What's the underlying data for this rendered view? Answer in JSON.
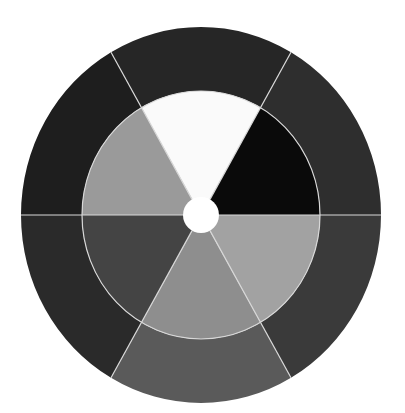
{
  "diagram": {
    "type": "two-ring sector wheel",
    "center": {
      "x": 201,
      "y": 215
    },
    "outer_ring": {
      "rx": 180,
      "ry": 188
    },
    "inner_ring": {
      "rx": 119,
      "ry": 124
    },
    "hub": {
      "r": 18,
      "color": "#ffffff"
    },
    "divider_color": "#d8d8d8",
    "divider_angles_deg": [
      0,
      60,
      120,
      180,
      240,
      300
    ],
    "outer_sectors": [
      {
        "name": "outer-upper-right",
        "start": 0,
        "end": 60,
        "color": "#2e2e2e"
      },
      {
        "name": "outer-top",
        "start": 60,
        "end": 120,
        "color": "#262626"
      },
      {
        "name": "outer-upper-left",
        "start": 120,
        "end": 180,
        "color": "#1e1e1e"
      },
      {
        "name": "outer-lower-left",
        "start": 180,
        "end": 240,
        "color": "#2a2a2a"
      },
      {
        "name": "outer-bottom",
        "start": 240,
        "end": 300,
        "color": "#5a5a5a"
      },
      {
        "name": "outer-lower-right",
        "start": 300,
        "end": 360,
        "color": "#3a3a3a"
      }
    ],
    "inner_sectors": [
      {
        "name": "inner-upper-right",
        "start": 0,
        "end": 60,
        "color": "#0a0a0a"
      },
      {
        "name": "inner-top",
        "start": 60,
        "end": 120,
        "color": "#fafafa"
      },
      {
        "name": "inner-upper-left",
        "start": 120,
        "end": 180,
        "color": "#9a9a9a"
      },
      {
        "name": "inner-lower-left",
        "start": 180,
        "end": 240,
        "color": "#444444"
      },
      {
        "name": "inner-bottom",
        "start": 240,
        "end": 300,
        "color": "#8e8e8e"
      },
      {
        "name": "inner-lower-right",
        "start": 300,
        "end": 360,
        "color": "#a2a2a2"
      }
    ]
  }
}
